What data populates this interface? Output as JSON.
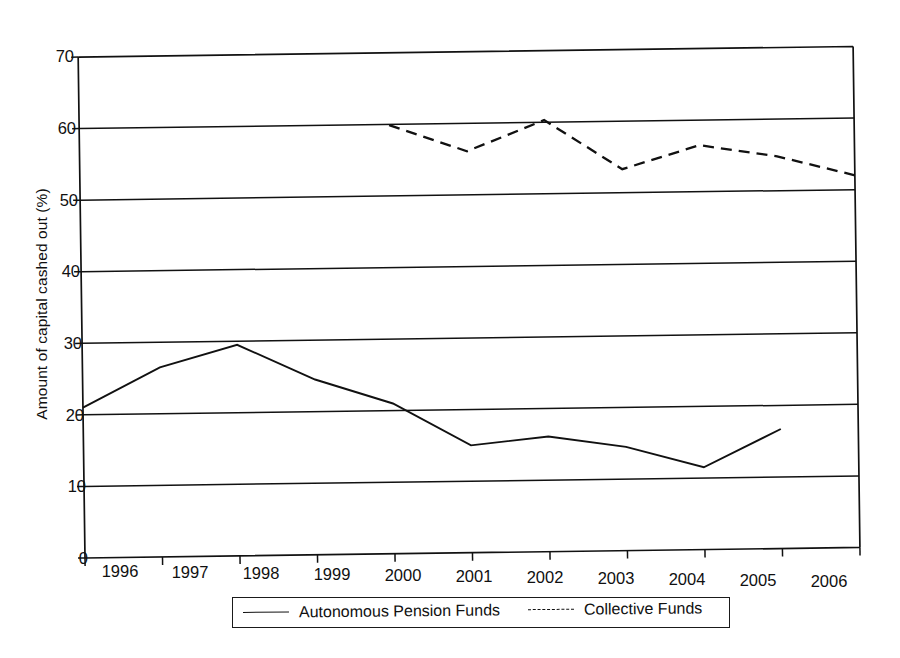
{
  "chart_data": {
    "type": "line",
    "title": "",
    "xlabel": "",
    "ylabel": "Amount of capital cashed out (%)",
    "x": [
      "1996",
      "1997",
      "1998",
      "1999",
      "2000",
      "2001",
      "2002",
      "2003",
      "2004",
      "2005",
      "2006"
    ],
    "xlim": [
      1996,
      2006
    ],
    "ylim": [
      0,
      70
    ],
    "yticks": [
      "0",
      "10",
      "20",
      "30",
      "40",
      "50",
      "60",
      "70"
    ],
    "grid": true,
    "grid_axis": "y",
    "legend_position": "below-axes",
    "series": [
      {
        "name": "Autonomous Pension Funds",
        "style": "solid",
        "color": "#111111",
        "x": [
          "1996",
          "1997",
          "1998",
          "1999",
          "2000",
          "2001",
          "2002",
          "2003",
          "2004",
          "2005"
        ],
        "values": [
          21.0,
          26.5,
          29.5,
          24.5,
          21.0,
          15.0,
          16.1,
          14.5,
          11.5,
          16.7
        ]
      },
      {
        "name": "Collective Funds",
        "style": "dashed",
        "color": "#111111",
        "x": [
          "2000",
          "2001",
          "2002",
          "2003",
          "2004",
          "2005",
          "2006"
        ],
        "values": [
          59.9,
          56.1,
          60.3,
          53.3,
          56.5,
          54.8,
          52.0
        ]
      }
    ]
  },
  "legend": {
    "entries": [
      {
        "label": "Autonomous Pension Funds",
        "style": "solid"
      },
      {
        "label": "Collective Funds",
        "style": "dashed"
      }
    ]
  },
  "axes": {
    "y_title": "Amount of capital cashed out (%)",
    "y_ticks": [
      "70",
      "60",
      "50",
      "40",
      "30",
      "20",
      "10",
      "0"
    ],
    "x_ticks": [
      "1996",
      "1997",
      "1998",
      "1999",
      "2000",
      "2001",
      "2002",
      "2003",
      "2004",
      "2005",
      "2006"
    ]
  },
  "colors": {
    "ink": "#111111",
    "background": "#ffffff"
  }
}
